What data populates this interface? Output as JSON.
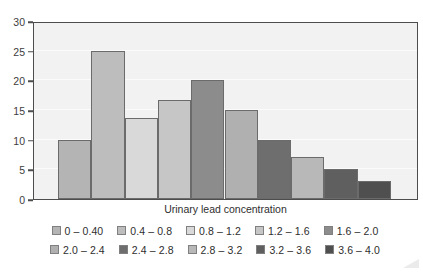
{
  "chart_data": {
    "type": "bar",
    "title": "",
    "xlabel": "Urinary lead concentration",
    "ylabel": "",
    "ylim": [
      0,
      30
    ],
    "yticks": [
      0,
      5,
      10,
      15,
      20,
      25,
      30
    ],
    "ytick_labels": [
      "0",
      "5",
      "10",
      "15",
      "20",
      "25",
      "30"
    ],
    "grid": true,
    "legend_position": "bottom",
    "categories": [
      "0 – 0.40",
      "0.4 – 0.8",
      "0.8 – 1.2",
      "1.2 – 1.6",
      "1.6 – 2.0",
      "2.0 – 2.4",
      "2.4 – 2.8",
      "2.8 – 3.2",
      "3.2 – 3.6",
      "3.6 – 4.0"
    ],
    "values": [
      10,
      25,
      13.7,
      16.7,
      20,
      15,
      10,
      7,
      5,
      3
    ],
    "colors": [
      "#b4b4b4",
      "#bdbdbd",
      "#d9d9d9",
      "#c6c6c6",
      "#8c8c8c",
      "#b0b0b0",
      "#6e6e6e",
      "#b8b8b8",
      "#5f5f5f",
      "#4f4f4f"
    ],
    "bar_edge_color": "#6b6b6b",
    "plot_background": "#f2f2f2",
    "axis_color": "#4d4d4d"
  },
  "legend": {
    "row1": [
      {
        "label": "0 – 0.40",
        "color": "#b4b4b4"
      },
      {
        "label": "0.4 – 0.8",
        "color": "#bdbdbd"
      },
      {
        "label": "0.8 – 1.2",
        "color": "#d9d9d9"
      },
      {
        "label": "1.2 – 1.6",
        "color": "#c6c6c6"
      },
      {
        "label": "1.6 – 2.0",
        "color": "#8c8c8c"
      }
    ],
    "row2": [
      {
        "label": "2.0 – 2.4",
        "color": "#b0b0b0"
      },
      {
        "label": "2.4 – 2.8",
        "color": "#6e6e6e"
      },
      {
        "label": "2.8 – 3.2",
        "color": "#b8b8b8"
      },
      {
        "label": "3.2 – 3.6",
        "color": "#5f5f5f"
      },
      {
        "label": "3.6 – 4.0",
        "color": "#4f4f4f"
      }
    ]
  }
}
